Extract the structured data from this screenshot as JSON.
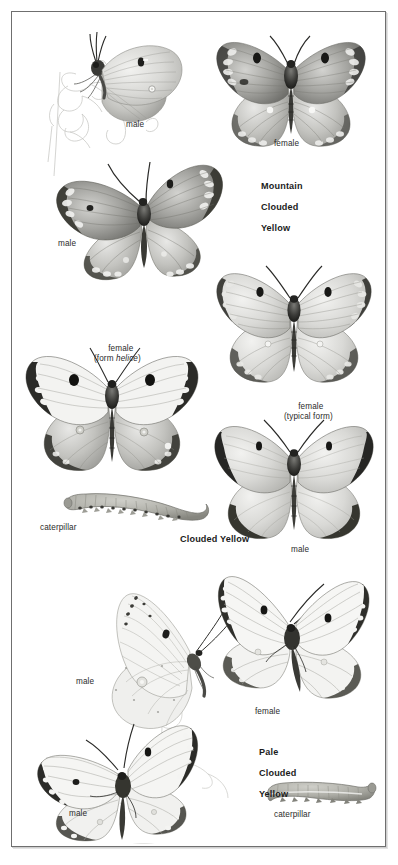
{
  "plate": {
    "title": "Clouded Yellow butterflies identification plate",
    "background_color": "#ffffff",
    "frame_color": "#6f6f6f",
    "text_color": "#2b2b2b",
    "species_text_color": "#1b1b1b"
  },
  "species": [
    {
      "id": "mountain-clouded-yellow",
      "name_lines": [
        "Mountain",
        "Clouded",
        "Yellow"
      ],
      "name_line1": "Mountain",
      "name_line2": "Clouded",
      "name_line3": "Yellow",
      "figures": [
        {
          "id": "mcy-male-underside",
          "label": "male",
          "view": "side / underside, perched on vetch sprig"
        },
        {
          "id": "mcy-female-upperside",
          "label": "female",
          "view": "upperside, wings spread"
        },
        {
          "id": "mcy-male-upperside",
          "label": "male",
          "view": "upperside, wings spread"
        }
      ]
    },
    {
      "id": "clouded-yellow",
      "name_lines": [
        "Clouded Yellow"
      ],
      "name_line1": "Clouded Yellow",
      "figures": [
        {
          "id": "cy-female-helice",
          "label_line1": "female",
          "label_line2_pre": "(form ",
          "label_line2_italic": "helice",
          "label_line2_post": ")",
          "view": "upperside, pale helice form"
        },
        {
          "id": "cy-female-typical",
          "label_line1": "female",
          "label_line2": "(typical form)",
          "view": "upperside, typical form"
        },
        {
          "id": "cy-male-upperside",
          "label": "male",
          "view": "upperside, wings spread"
        },
        {
          "id": "cy-caterpillar",
          "label": "caterpillar",
          "view": "lateral larva"
        }
      ]
    },
    {
      "id": "pale-clouded-yellow",
      "name_lines": [
        "Pale",
        "Clouded",
        "Yellow"
      ],
      "name_line1": "Pale",
      "name_line2": "Clouded",
      "name_line3": "Yellow",
      "figures": [
        {
          "id": "pcy-male-underside",
          "label": "male",
          "view": "side / underside, perched on clover"
        },
        {
          "id": "pcy-female-upperside",
          "label": "female",
          "view": "upperside, wings spread"
        },
        {
          "id": "pcy-male-upperside",
          "label": "male",
          "view": "upperside on clover stem"
        },
        {
          "id": "pcy-caterpillar",
          "label": "caterpillar",
          "view": "lateral larva"
        }
      ]
    }
  ],
  "labels": {
    "male": "male",
    "female": "female",
    "caterpillar": "caterpillar",
    "form_helice_line1": "female",
    "form_helice_pre": "(form ",
    "form_helice_italic": "helice",
    "form_helice_post": ")",
    "typical_form_line1": "female",
    "typical_form_line2": "(typical form)"
  }
}
